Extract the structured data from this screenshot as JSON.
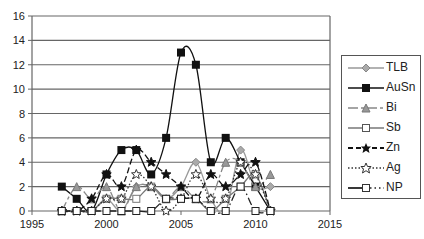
{
  "chart_data": {
    "type": "line",
    "title": "",
    "xlabel": "",
    "ylabel": "",
    "xlim": [
      1995,
      2015
    ],
    "ylim": [
      0,
      16
    ],
    "x_ticks": [
      1995,
      2000,
      2005,
      2010,
      2015
    ],
    "y_ticks": [
      0,
      2,
      4,
      6,
      8,
      10,
      12,
      14,
      16
    ],
    "grid": "horizontal",
    "legend_position": "right",
    "x": [
      1997,
      1998,
      1999,
      2000,
      2001,
      2002,
      2003,
      2004,
      2005,
      2006,
      2007,
      2008,
      2009,
      2010,
      2011
    ],
    "series": [
      {
        "name": "TLB",
        "color": "#999999",
        "marker": "diamond",
        "line": "solid",
        "values": [
          0,
          0,
          0,
          1,
          0,
          2,
          2,
          1,
          2,
          4,
          1,
          0,
          5,
          2,
          2
        ]
      },
      {
        "name": "AuSn",
        "color": "#111111",
        "marker": "square",
        "line": "solid",
        "values": [
          2,
          1,
          0,
          3,
          5,
          5,
          3,
          6,
          13,
          12,
          4,
          6,
          4,
          2,
          0
        ]
      },
      {
        "name": "Bi",
        "color": "#888888",
        "marker": "triangle",
        "line": "dashdot",
        "values": [
          0,
          2,
          1,
          2,
          0,
          2,
          2,
          1,
          2,
          1,
          1,
          4,
          4,
          2,
          3
        ]
      },
      {
        "name": "Sb",
        "color": "#777777",
        "marker": "square-open",
        "line": "solid",
        "values": [
          0,
          0,
          0,
          1,
          1,
          1,
          2,
          1,
          1,
          1,
          0,
          1,
          2,
          3,
          0
        ]
      },
      {
        "name": "Zn",
        "color": "#111111",
        "marker": "star",
        "line": "dashed",
        "values": [
          0,
          0,
          1,
          3,
          2,
          5,
          4,
          3,
          2,
          1,
          3,
          2,
          3,
          4,
          0
        ]
      },
      {
        "name": "Ag",
        "color": "#333333",
        "marker": "star-open",
        "line": "dotted",
        "values": [
          0,
          0,
          0,
          1,
          1,
          3,
          2,
          0,
          1,
          3,
          1,
          1,
          4,
          3,
          0
        ]
      },
      {
        "name": "NP",
        "color": "#222222",
        "marker": "square-open",
        "line": "dashdot2",
        "values": [
          0,
          0,
          0,
          0,
          0,
          0,
          0,
          1,
          1,
          1,
          0,
          0,
          2,
          0,
          0
        ]
      }
    ]
  },
  "legend": {
    "items": [
      "TLB",
      "AuSn",
      "Bi",
      "Sb",
      "Zn",
      "Ag",
      "NP"
    ]
  }
}
